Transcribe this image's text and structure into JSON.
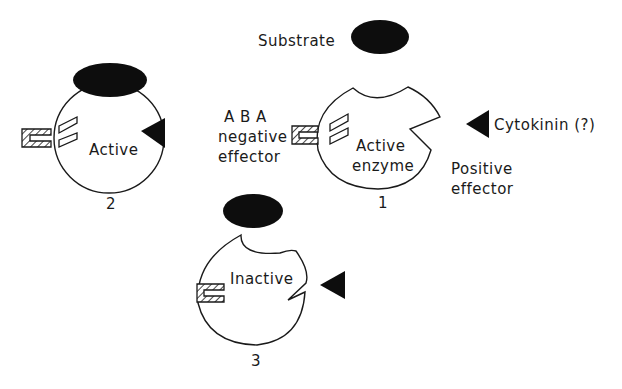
{
  "labels": {
    "substrate": "Substrate",
    "aba_line1": "A B A",
    "aba_line2": "negative",
    "aba_line3": "effector",
    "cytokinin": "Cytokinin (?)",
    "positive_line1": "Positive",
    "positive_line2": "effector"
  },
  "enzymes": [
    {
      "id": "1",
      "number": "1",
      "state_line1": "Active",
      "state_line2": "enzyme"
    },
    {
      "id": "2",
      "number": "2",
      "state_line1": "Active",
      "state_line2": ""
    },
    {
      "id": "3",
      "number": "3",
      "state_line1": "Inactive",
      "state_line2": ""
    }
  ],
  "colors": {
    "ink": "#1a1a1a",
    "fill_dark": "#0d0d0d",
    "background": "#ffffff"
  }
}
